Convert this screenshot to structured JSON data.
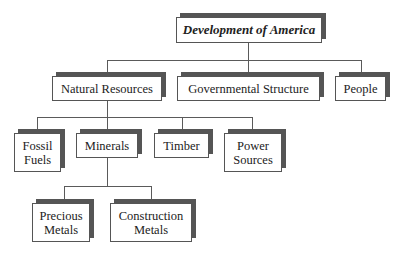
{
  "diagram": {
    "type": "hierarchy",
    "root": {
      "label": "Development of America"
    },
    "level1": [
      {
        "label": "Natural Resources"
      },
      {
        "label": "Governmental Structure"
      },
      {
        "label": "People"
      }
    ],
    "level2": [
      {
        "label": "Fossil\nFuels",
        "parent": "Natural Resources"
      },
      {
        "label": "Minerals",
        "parent": "Natural Resources"
      },
      {
        "label": "Timber",
        "parent": "Natural Resources"
      },
      {
        "label": "Power\nSources",
        "parent": "Natural Resources"
      }
    ],
    "level3": [
      {
        "label": "Precious\nMetals",
        "parent": "Minerals"
      },
      {
        "label": "Construction\nMetals",
        "parent": "Minerals"
      }
    ]
  }
}
